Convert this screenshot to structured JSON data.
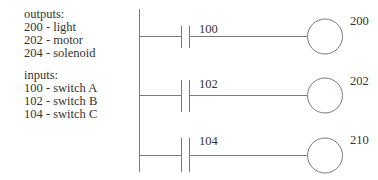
{
  "legend": {
    "outputs": {
      "title": "outputs:",
      "items": [
        "200 - light",
        "202 - motor",
        "204 - solenoid"
      ]
    },
    "inputs": {
      "title": "inputs:",
      "items": [
        "100 - switch A",
        "102 - switch B",
        "104 - switch C"
      ]
    }
  },
  "ladder": {
    "rungs": [
      {
        "contact": "100",
        "coil": "200"
      },
      {
        "contact": "102",
        "coil": "202"
      },
      {
        "contact": "104",
        "coil": "210"
      }
    ]
  },
  "colors": {
    "line": "#7a7a7a",
    "text": "#333333"
  }
}
